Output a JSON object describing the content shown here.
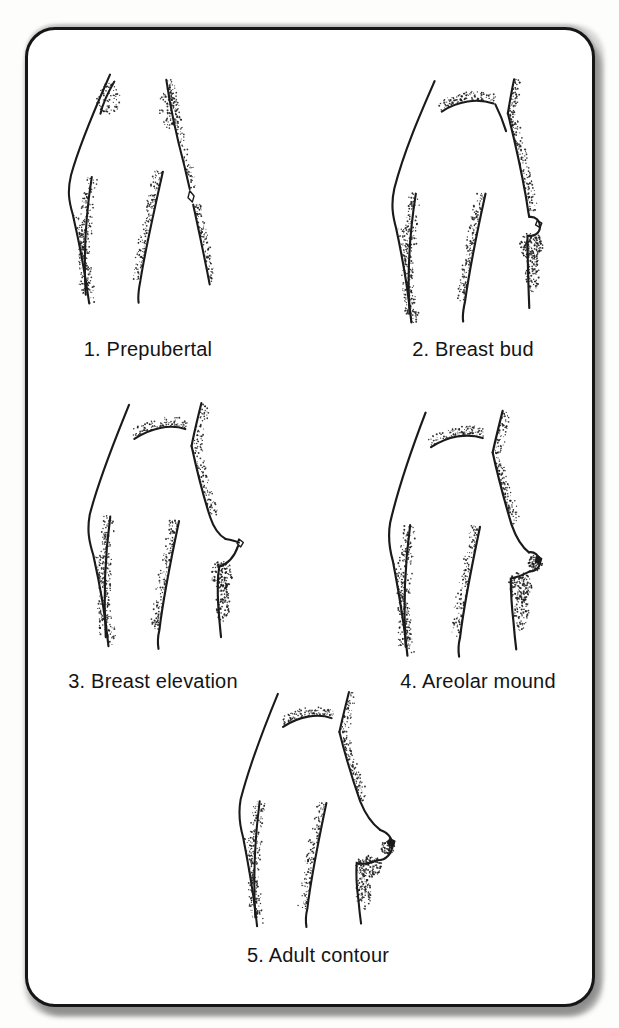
{
  "panel": {
    "paper_color": "#ffffff",
    "ink_color": "#1a1a1a",
    "border_color": "#161616",
    "shadow_color": "#8f8f8f"
  },
  "figures": [
    {
      "id": "stage-1",
      "label": "1. Prepubertal"
    },
    {
      "id": "stage-2",
      "label": "2. Breast bud"
    },
    {
      "id": "stage-3",
      "label": "3. Breast elevation"
    },
    {
      "id": "stage-4",
      "label": "4. Areolar mound"
    },
    {
      "id": "stage-5",
      "label": "5. Adult contour"
    }
  ]
}
